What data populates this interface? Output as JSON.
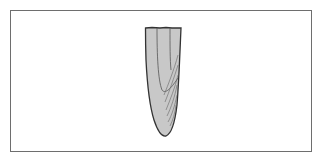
{
  "figure": {
    "colors": {
      "frame_border": "#6e6e6e",
      "fill": "#c8c8c8",
      "outline": "#333333",
      "inner_lines": "#555555"
    }
  }
}
